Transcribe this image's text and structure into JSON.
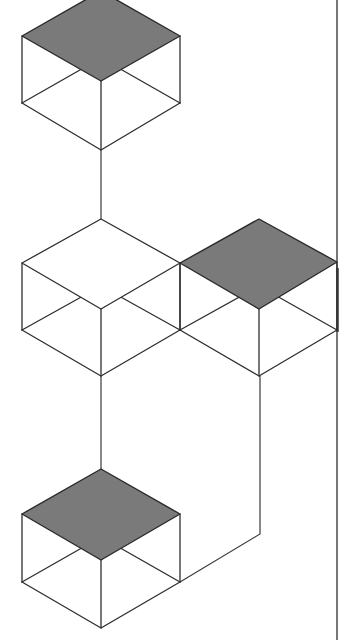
{
  "diagram": {
    "colors": {
      "shaded_top": "#7a7a7a",
      "line": "#2e2e2e",
      "background": "#ffffff"
    },
    "cubes": [
      {
        "id": "cube-top",
        "center_x": 101,
        "top_y": -9,
        "shaded": true
      },
      {
        "id": "cube-middle-left",
        "center_x": 101,
        "top_y": 219,
        "shaded": false
      },
      {
        "id": "cube-middle-right",
        "center_x": 259,
        "top_y": 219,
        "shaded": true
      },
      {
        "id": "cube-bottom",
        "center_x": 101,
        "top_y": 469,
        "shaded": true
      }
    ],
    "connectors": [
      {
        "from": "cube-top",
        "to": "cube-middle-left"
      },
      {
        "from": "cube-middle-left",
        "to": "cube-bottom"
      },
      {
        "from": "cube-middle-right",
        "to": "cube-bottom"
      }
    ]
  }
}
